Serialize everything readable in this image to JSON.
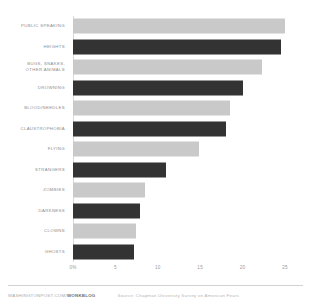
{
  "chart_data": {
    "type": "bar",
    "orientation": "horizontal",
    "title": "",
    "subtitle": "",
    "xlabel": "",
    "ylabel": "",
    "xlim": [
      0,
      25
    ],
    "grid": true,
    "legend": null,
    "categories": [
      "PUBLIC SPEAKING",
      "HEIGHTS",
      "BUGS, SNAKES,\nOTHER ANIMALS",
      "DROWNING",
      "BLOOD/NEEDLES",
      "CLAUSTROPHOBIA",
      "FLYING",
      "STRANGERS",
      "ZOMBIES",
      "DARKNESS",
      "CLOWNS",
      "GHOSTS"
    ],
    "values": [
      25.0,
      24.5,
      22.3,
      20.0,
      18.5,
      18.0,
      14.8,
      11.0,
      8.5,
      7.9,
      7.4,
      7.2
    ],
    "bar_colors": [
      "#c9c9c9",
      "#333333",
      "#c9c9c9",
      "#333333",
      "#c9c9c9",
      "#333333",
      "#c9c9c9",
      "#333333",
      "#c9c9c9",
      "#333333",
      "#c9c9c9",
      "#333333"
    ],
    "xticks": [
      {
        "value": 0,
        "label": "0%"
      },
      {
        "value": 5,
        "label": "5"
      },
      {
        "value": 10,
        "label": "10"
      },
      {
        "value": 15,
        "label": "15"
      },
      {
        "value": 20,
        "label": "20"
      },
      {
        "value": 25,
        "label": "25"
      }
    ]
  },
  "footer": {
    "credit_site": "WASHINGTONPOST.COM/",
    "credit_brand": "WONKBLOG",
    "source": "Source: Chapman University Survey on American Fears"
  },
  "colors": {
    "light_bar": "#c9c9c9",
    "dark_bar": "#333333",
    "gridline": "#ffffff",
    "text": "#8d8d8d"
  }
}
